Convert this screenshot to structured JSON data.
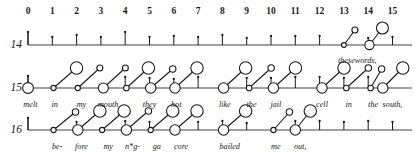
{
  "figure": {
    "type": "rhythm-grid-notation"
  },
  "grid": {
    "beat_labels": [
      "0",
      "1",
      "2",
      "3",
      "4",
      "5",
      "6",
      "7",
      "8",
      "9",
      "10",
      "11",
      "12",
      "13",
      "14",
      "15"
    ],
    "x_start": 28,
    "x_step": 24.3,
    "label_y": 12,
    "axis_color": "#808080",
    "ink_color": "#1a1a1a"
  },
  "rows": [
    {
      "label": "14",
      "baseline_y": 45,
      "label_x": 22,
      "ticks": [
        {
          "beat": 0,
          "height": 13
        },
        {
          "beat": 1,
          "height": 8
        },
        {
          "beat": 2,
          "height": 10
        },
        {
          "beat": 3,
          "height": 8
        },
        {
          "beat": 4,
          "height": 13
        },
        {
          "beat": 5,
          "height": 8
        },
        {
          "beat": 6,
          "height": 9
        },
        {
          "beat": 7,
          "height": 8
        },
        {
          "beat": 8,
          "height": 10
        },
        {
          "beat": 9,
          "height": 7
        },
        {
          "beat": 10,
          "height": 9
        },
        {
          "beat": 11,
          "height": 9
        },
        {
          "beat": 12,
          "height": 9
        },
        {
          "beat": 14,
          "height": 7
        },
        {
          "beat": 15,
          "height": 8
        }
      ],
      "notes": [
        {
          "beat": 13.0,
          "onset_r": 2.4,
          "head_dx": 11,
          "head_dy": -15,
          "head_r": 3.0
        },
        {
          "beat": 14.05,
          "onset_r": 4.6,
          "head_dx": 13,
          "head_dy": -17,
          "head_r": 6.0
        }
      ],
      "lyrics": [
        {
          "beat": 13.55,
          "text": "thesewords,",
          "dy": 12
        }
      ]
    },
    {
      "label": "15",
      "baseline_y": 88,
      "label_x": 22,
      "ticks": [
        {
          "beat": 0,
          "height": 12
        },
        {
          "beat": 4,
          "height": 11
        },
        {
          "beat": 5,
          "height": 10
        },
        {
          "beat": 6,
          "height": 9
        },
        {
          "beat": 7,
          "height": 11
        },
        {
          "beat": 9,
          "height": 10
        },
        {
          "beat": 10,
          "height": 10
        },
        {
          "beat": 11,
          "height": 11
        },
        {
          "beat": 12,
          "height": 11
        },
        {
          "beat": 13,
          "height": 10
        },
        {
          "beat": 14,
          "height": 11
        }
      ],
      "notes": [
        {
          "beat": 0.0,
          "onset_r": 5.4,
          "head_dx": 0,
          "head_dy": 0,
          "head_r": 0.0
        },
        {
          "beat": 1.05,
          "onset_r": 2.6,
          "head_dx": 23,
          "head_dy": -20,
          "head_r": 6.2
        },
        {
          "beat": 2.05,
          "onset_r": 2.6,
          "head_dx": 22,
          "head_dy": -20,
          "head_r": 3.0
        },
        {
          "beat": 3.1,
          "onset_r": 5.0,
          "head_dx": 22,
          "head_dy": -20,
          "head_r": 3.0
        },
        {
          "beat": 4.05,
          "onset_r": 2.8,
          "head_dx": 22,
          "head_dy": -20,
          "head_r": 6.2
        },
        {
          "beat": 5.05,
          "onset_r": 5.2,
          "head_dx": 22,
          "head_dy": -19,
          "head_r": 3.2
        },
        {
          "beat": 6.05,
          "onset_r": 5.2,
          "head_dx": 22,
          "head_dy": -20,
          "head_r": 6.2
        },
        {
          "beat": 8.05,
          "onset_r": 5.2,
          "head_dx": 22,
          "head_dy": -20,
          "head_r": 6.2
        },
        {
          "beat": 9.1,
          "onset_r": 2.8,
          "head_dx": 22,
          "head_dy": -20,
          "head_r": 3.2
        },
        {
          "beat": 10.1,
          "onset_r": 5.2,
          "head_dx": 22,
          "head_dy": -20,
          "head_r": 6.2
        },
        {
          "beat": 12.1,
          "onset_r": 5.2,
          "head_dx": 22,
          "head_dy": -20,
          "head_r": 6.2
        },
        {
          "beat": 13.1,
          "onset_r": 2.8,
          "head_dx": 22,
          "head_dy": -20,
          "head_r": 3.2
        },
        {
          "beat": 14.1,
          "onset_r": 2.8,
          "head_dx": 11,
          "head_dy": -19,
          "head_r": 3.2
        },
        {
          "beat": 14.6,
          "onset_r": 5.2,
          "head_dx": 20,
          "head_dy": -20,
          "head_r": 6.2
        }
      ],
      "lyrics": [
        {
          "beat": 0.1,
          "text": "melt",
          "dy": 13
        },
        {
          "beat": 1.1,
          "text": "in",
          "dy": 13
        },
        {
          "beat": 2.2,
          "text": "my",
          "dy": 13
        },
        {
          "beat": 3.3,
          "text": "mouth",
          "dy": 13
        },
        {
          "beat": 5.0,
          "text": "they",
          "dy": 13
        },
        {
          "beat": 6.1,
          "text": "hot",
          "dy": 13
        },
        {
          "beat": 8.1,
          "text": "like",
          "dy": 13
        },
        {
          "beat": 9.2,
          "text": "the",
          "dy": 13
        },
        {
          "beat": 10.2,
          "text": "jail",
          "dy": 13
        },
        {
          "beat": 12.1,
          "text": "cell",
          "dy": 13
        },
        {
          "beat": 13.2,
          "text": "in",
          "dy": 13
        },
        {
          "beat": 14.2,
          "text": "the",
          "dy": 13
        },
        {
          "beat": 15.0,
          "text": "south,",
          "dy": 13
        }
      ]
    },
    {
      "label": "16",
      "baseline_y": 130,
      "label_x": 22,
      "ticks": [
        {
          "beat": 0,
          "height": 12
        },
        {
          "beat": 2,
          "height": 8
        },
        {
          "beat": 4,
          "height": 9
        },
        {
          "beat": 5,
          "height": 8
        },
        {
          "beat": 7,
          "height": 8
        },
        {
          "beat": 8,
          "height": 9
        },
        {
          "beat": 9,
          "height": 7
        },
        {
          "beat": 11,
          "height": 9
        },
        {
          "beat": 12,
          "height": 9
        },
        {
          "beat": 13,
          "height": 8
        },
        {
          "beat": 14,
          "height": 9
        },
        {
          "beat": 15,
          "height": 8
        }
      ],
      "notes": [
        {
          "beat": 1.05,
          "onset_r": 2.6,
          "head_dx": 22,
          "head_dy": -18,
          "head_r": 3.2
        },
        {
          "beat": 2.05,
          "onset_r": 5.2,
          "head_dx": 22,
          "head_dy": -19,
          "head_r": 6.2
        },
        {
          "beat": 3.05,
          "onset_r": 2.6,
          "head_dx": 22,
          "head_dy": -19,
          "head_r": 6.2
        },
        {
          "beat": 4.05,
          "onset_r": 5.2,
          "head_dx": 22,
          "head_dy": -19,
          "head_r": 3.2
        },
        {
          "beat": 5.05,
          "onset_r": 2.6,
          "head_dx": 22,
          "head_dy": -19,
          "head_r": 6.2
        },
        {
          "beat": 6.05,
          "onset_r": 5.2,
          "head_dx": 22,
          "head_dy": -19,
          "head_r": 6.2
        },
        {
          "beat": 8.05,
          "onset_r": 5.2,
          "head_dx": 22,
          "head_dy": -19,
          "head_r": 6.2
        },
        {
          "beat": 10.1,
          "onset_r": 2.6,
          "head_dx": 16,
          "head_dy": -18,
          "head_r": 3.2
        },
        {
          "beat": 11.0,
          "onset_r": 5.2,
          "head_dx": 15,
          "head_dy": -19,
          "head_r": 6.2
        }
      ],
      "lyrics": [
        {
          "beat": 1.2,
          "text": "be-",
          "dy": 13
        },
        {
          "beat": 2.2,
          "text": "fore",
          "dy": 13
        },
        {
          "beat": 3.3,
          "text": "my",
          "dy": 13
        },
        {
          "beat": 4.3,
          "text": "n*g-",
          "dy": 13
        },
        {
          "beat": 5.3,
          "text": "ga",
          "dy": 13
        },
        {
          "beat": 6.3,
          "text": "core",
          "dy": 13
        },
        {
          "beat": 8.3,
          "text": "bailed",
          "dy": 13
        },
        {
          "beat": 10.2,
          "text": "me",
          "dy": 13
        },
        {
          "beat": 11.2,
          "text": "out,",
          "dy": 13
        }
      ]
    }
  ]
}
